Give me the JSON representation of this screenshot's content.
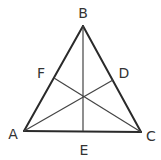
{
  "diagram": {
    "type": "triangle-with-medians",
    "vertices": {
      "A": {
        "label": "A",
        "x": 24,
        "y": 131
      },
      "B": {
        "label": "B",
        "x": 83,
        "y": 26
      },
      "C": {
        "label": "C",
        "x": 141,
        "y": 132
      }
    },
    "midpoints": {
      "D": {
        "label": "D",
        "x": 113,
        "y": 80
      },
      "E": {
        "label": "E",
        "x": 83,
        "y": 131
      },
      "F": {
        "label": "F",
        "x": 54,
        "y": 78
      }
    },
    "segments": [
      {
        "name": "AB",
        "from": "A",
        "to": "B",
        "kind": "side"
      },
      {
        "name": "BC",
        "from": "B",
        "to": "C",
        "kind": "side"
      },
      {
        "name": "CA",
        "from": "C",
        "to": "A",
        "kind": "side"
      },
      {
        "name": "AD",
        "from": "A",
        "to": "D",
        "kind": "median"
      },
      {
        "name": "BE",
        "from": "B",
        "to": "E",
        "kind": "median"
      },
      {
        "name": "CF",
        "from": "C",
        "to": "F",
        "kind": "median"
      }
    ],
    "labels": {
      "A": "A",
      "B": "B",
      "C": "C",
      "D": "D",
      "E": "E",
      "F": "F"
    },
    "colors": {
      "line": "#2a2a2a",
      "text": "#333333",
      "background": "#ffffff"
    }
  }
}
